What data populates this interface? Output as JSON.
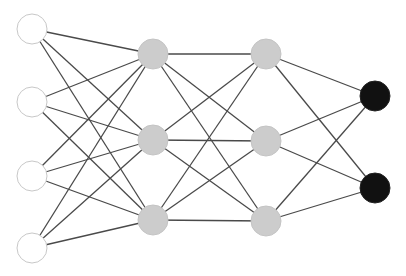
{
  "diagram": {
    "type": "neural-network",
    "colors": {
      "input_fill": "#ffffff",
      "input_stroke": "#c8c8c8",
      "hidden_fill": "#cccccc",
      "hidden_stroke": "#c4c4c4",
      "output_fill": "#111111",
      "output_stroke": "#222222",
      "edge": "#4a4a4a"
    },
    "node_radius": 15,
    "layers": [
      {
        "name": "input",
        "x": 32,
        "ys": [
          29,
          102,
          176,
          248
        ]
      },
      {
        "name": "hidden-1",
        "x": 153,
        "ys": [
          54,
          140,
          220
        ]
      },
      {
        "name": "hidden-2",
        "x": 266,
        "ys": [
          54,
          141,
          221
        ]
      },
      {
        "name": "output",
        "x": 375,
        "ys": [
          96,
          188
        ]
      }
    ],
    "connectivity": "fully-connected"
  }
}
